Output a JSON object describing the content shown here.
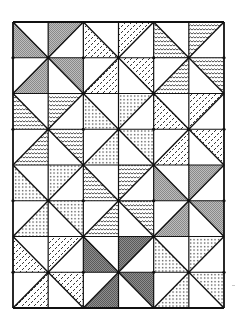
{
  "figure": {
    "type": "quilt-pattern",
    "grid": {
      "columns": 6,
      "rows": 8,
      "left": 13,
      "top": 22,
      "right": 224,
      "bottom": 308
    },
    "line_color": "#111111",
    "fills": {
      "grey": "#a8a8a8",
      "darkgrey": "#7a7a7a",
      "dashes": "dashes",
      "waves": "waves",
      "dots": "dots"
    },
    "rows": [
      [
        {
          "diag": "\\",
          "half": "BL",
          "fill": "grey"
        },
        {
          "diag": "/",
          "half": "TL",
          "fill": "grey"
        },
        {
          "diag": "\\",
          "half": "BL",
          "fill": "dashes"
        },
        {
          "diag": "/",
          "half": "TL",
          "fill": "dashes"
        },
        {
          "diag": "\\",
          "half": "BL",
          "fill": "waves"
        },
        {
          "diag": "/",
          "half": "TL",
          "fill": "waves"
        }
      ],
      [
        {
          "diag": "/",
          "half": "BR",
          "fill": "grey"
        },
        {
          "diag": "\\",
          "half": "TR",
          "fill": "grey"
        },
        {
          "diag": "/",
          "half": "BR",
          "fill": "dashes"
        },
        {
          "diag": "\\",
          "half": "TR",
          "fill": "dashes"
        },
        {
          "diag": "/",
          "half": "BR",
          "fill": "waves"
        },
        {
          "diag": "\\",
          "half": "TR",
          "fill": "waves"
        }
      ],
      [
        {
          "diag": "\\",
          "half": "BL",
          "fill": "waves"
        },
        {
          "diag": "/",
          "half": "TL",
          "fill": "waves"
        },
        {
          "diag": "\\",
          "half": "BL",
          "fill": "dots"
        },
        {
          "diag": "/",
          "half": "TL",
          "fill": "dots"
        },
        {
          "diag": "\\",
          "half": "BL",
          "fill": "dashes"
        },
        {
          "diag": "/",
          "half": "TL",
          "fill": "dashes"
        }
      ],
      [
        {
          "diag": "/",
          "half": "BR",
          "fill": "waves"
        },
        {
          "diag": "\\",
          "half": "TR",
          "fill": "waves"
        },
        {
          "diag": "/",
          "half": "BR",
          "fill": "dots"
        },
        {
          "diag": "\\",
          "half": "TR",
          "fill": "dots"
        },
        {
          "diag": "/",
          "half": "BR",
          "fill": "dashes"
        },
        {
          "diag": "\\",
          "half": "TR",
          "fill": "dashes"
        }
      ],
      [
        {
          "diag": "\\",
          "half": "BL",
          "fill": "dots"
        },
        {
          "diag": "/",
          "half": "TL",
          "fill": "dots"
        },
        {
          "diag": "\\",
          "half": "BL",
          "fill": "waves"
        },
        {
          "diag": "/",
          "half": "TL",
          "fill": "waves"
        },
        {
          "diag": "\\",
          "half": "BL",
          "fill": "grey"
        },
        {
          "diag": "/",
          "half": "TL",
          "fill": "grey"
        }
      ],
      [
        {
          "diag": "/",
          "half": "BR",
          "fill": "dots"
        },
        {
          "diag": "\\",
          "half": "TR",
          "fill": "dots"
        },
        {
          "diag": "/",
          "half": "BR",
          "fill": "waves"
        },
        {
          "diag": "\\",
          "half": "TR",
          "fill": "waves"
        },
        {
          "diag": "/",
          "half": "BR",
          "fill": "grey"
        },
        {
          "diag": "\\",
          "half": "TR",
          "fill": "grey"
        }
      ],
      [
        {
          "diag": "\\",
          "half": "BL",
          "fill": "dashes"
        },
        {
          "diag": "/",
          "half": "TL",
          "fill": "dashes"
        },
        {
          "diag": "\\",
          "half": "BL",
          "fill": "darkgrey"
        },
        {
          "diag": "/",
          "half": "TL",
          "fill": "darkgrey"
        },
        {
          "diag": "\\",
          "half": "BL",
          "fill": "dots"
        },
        {
          "diag": "/",
          "half": "TL",
          "fill": "dots"
        }
      ],
      [
        {
          "diag": "/",
          "half": "BR",
          "fill": "dashes"
        },
        {
          "diag": "\\",
          "half": "TR",
          "fill": "dashes"
        },
        {
          "diag": "/",
          "half": "BR",
          "fill": "darkgrey"
        },
        {
          "diag": "\\",
          "half": "TR",
          "fill": "darkgrey"
        },
        {
          "diag": "/",
          "half": "BR",
          "fill": "dots"
        },
        {
          "diag": "\\",
          "half": "TR",
          "fill": "dots"
        }
      ]
    ]
  }
}
